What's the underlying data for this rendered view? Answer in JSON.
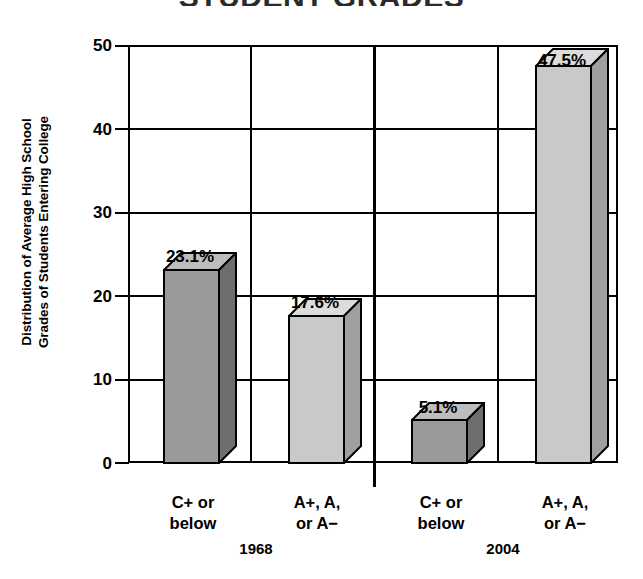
{
  "chart_data": {
    "type": "bar",
    "title": "STUDENT GRADES",
    "ylabel_line1": "Distribution of Average High School",
    "ylabel_line2": "Grades of Students Entering College",
    "xlabel": "",
    "ylim": [
      0,
      50
    ],
    "yticks": [
      "0",
      "10",
      "20",
      "30",
      "40",
      "50"
    ],
    "ytick_values": [
      0,
      10,
      20,
      30,
      40,
      50
    ],
    "grid": "both",
    "legend": "none",
    "groups": [
      {
        "name": "1968",
        "label": "1968"
      },
      {
        "name": "2004",
        "label": "2004"
      }
    ],
    "categories": [
      "C+ or below",
      "A+, A, or A−",
      "C+ or below",
      "A+, A, or A−"
    ],
    "values": [
      23.1,
      17.6,
      5.1,
      47.5
    ],
    "bars": [
      {
        "group": "1968",
        "cat_line1": "C+ or",
        "cat_line2": "below",
        "value": 23.1,
        "label": "23.1%",
        "fill": "#9a9a9a",
        "top_fill": "#bdbdbd",
        "side_fill": "#6e6e6e"
      },
      {
        "group": "1968",
        "cat_line1": "A+, A,",
        "cat_line2": "or A−",
        "value": 17.6,
        "label": "17.6%",
        "fill": "#c9c9c9",
        "top_fill": "#dcdcdc",
        "side_fill": "#9f9f9f"
      },
      {
        "group": "2004",
        "cat_line1": "C+ or",
        "cat_line2": "below",
        "value": 5.1,
        "label": "5.1%",
        "fill": "#9a9a9a",
        "top_fill": "#bdbdbd",
        "side_fill": "#6e6e6e"
      },
      {
        "group": "2004",
        "cat_line1": "A+, A,",
        "cat_line2": "or A−",
        "value": 47.5,
        "label": "47.5%",
        "fill": "#c9c9c9",
        "top_fill": "#dcdcdc",
        "side_fill": "#9f9f9f"
      }
    ],
    "colors": {
      "axis": "#000000",
      "background": "#ffffff",
      "dark_bar": "#9a9a9a",
      "light_bar": "#c9c9c9"
    }
  }
}
